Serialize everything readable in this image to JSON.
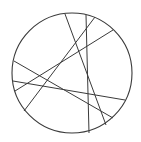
{
  "diagram": {
    "type": "circle-with-chords",
    "stroke_color": "#3a3a3a",
    "background": "#ffffff",
    "circle": {
      "cx": 72,
      "cy": 73,
      "r": 60
    },
    "chords": [
      {
        "x1": 65,
        "y1": 14,
        "x2": 106,
        "y2": 125
      },
      {
        "x1": 86,
        "y1": 15,
        "x2": 89,
        "y2": 133
      },
      {
        "x1": 95,
        "y1": 17,
        "x2": 24,
        "y2": 111
      },
      {
        "x1": 113,
        "y1": 30,
        "x2": 15,
        "y2": 91
      },
      {
        "x1": 14,
        "y1": 61,
        "x2": 113,
        "y2": 118
      },
      {
        "x1": 13,
        "y1": 81,
        "x2": 125,
        "y2": 100
      }
    ]
  }
}
